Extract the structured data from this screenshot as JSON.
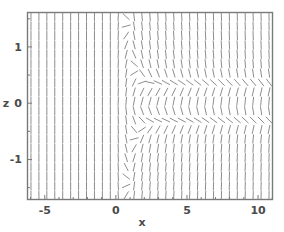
{
  "chart_data": {
    "type": "quiver",
    "title": "",
    "subtitle": "",
    "xlabel": "x",
    "ylabel": "z",
    "xlim": [
      -6.25,
      11.05
    ],
    "ylim": [
      -1.72,
      1.62
    ],
    "xticks": [
      -5,
      0,
      5,
      10
    ],
    "xticklabels": [
      "-5",
      "0",
      "5",
      "10"
    ],
    "yticks": [
      1,
      0,
      -1
    ],
    "yticklabels": [
      "1",
      "0",
      "-1"
    ],
    "grid": false,
    "legend": null,
    "annotations": [],
    "field": {
      "segment_length_px": 9,
      "grid_nx": 31,
      "grid_ny": 20,
      "asymptote_upper": 0.33,
      "asymptote_lower": -0.33,
      "critical_x": 0,
      "slope_color": "#808080",
      "slope_width_px": 0.9
    },
    "frame": {
      "color": "#7a7a7a",
      "width_px": 1.4,
      "fill": "#ffffff"
    },
    "tick_color": "#7a7a7a",
    "text_color": "#4a4a4a",
    "plot_box_px": {
      "left": 27,
      "top": 12,
      "right": 273,
      "bottom": 200
    }
  },
  "figure": {
    "background": "#ffffff",
    "width": 284,
    "height": 232
  }
}
